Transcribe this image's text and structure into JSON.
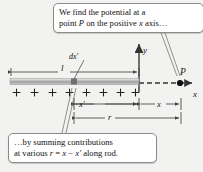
{
  "figure": {
    "background_color": "#f2f2f0",
    "ink_color": "#333333"
  },
  "callouts": [
    {
      "id": "top",
      "line1": "We find the potential at a",
      "line2_pre": "point ",
      "line2_italic": "P",
      "line2_mid": " on the positive ",
      "line2_italic2": "x",
      "line2_post": " axis…",
      "points_to": "point-P"
    },
    {
      "id": "bottom",
      "line1": "…by summing contributions",
      "line2_pre": "at various ",
      "line2_italic": "r",
      "line2_mid": " = ",
      "line2_italic2": "x",
      "line2_mid2": " − ",
      "line2_italic3": "x′",
      "line2_post": " along rod.",
      "points_to": "dx-prime-element"
    }
  ],
  "labels": {
    "rod_length": "l",
    "element": "dx′",
    "y_axis": "y",
    "x_axis": "x",
    "point": "P",
    "x_prime": "x′",
    "x": "x",
    "r": "r"
  },
  "rod": {
    "charge_symbol": "+",
    "charge_count": 8,
    "fill_light": "#f0f0f0",
    "fill_dark": "#9a9a9a",
    "element_color": "#6e6e6e"
  },
  "dimensions": [
    {
      "name": "l",
      "label": "l",
      "from": "rod-left-end",
      "to": "origin"
    },
    {
      "name": "x-prime",
      "label": "x′",
      "from": "dx-prime-element",
      "to": "origin"
    },
    {
      "name": "x",
      "label": "x",
      "from": "origin",
      "to": "point-P"
    },
    {
      "name": "r",
      "label": "r",
      "from": "dx-prime-element",
      "to": "point-P"
    }
  ]
}
